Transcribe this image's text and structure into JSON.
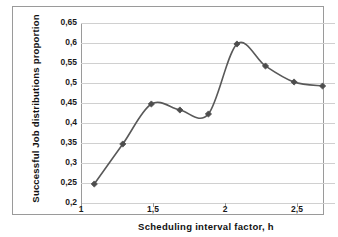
{
  "chart_data": {
    "type": "line",
    "title": "",
    "xlabel": "Scheduling interval factor, h",
    "ylabel": "Successful Job distributions proportion",
    "x": [
      1,
      1.2,
      1.4,
      1.6,
      1.8,
      2.0,
      2.2,
      2.4,
      2.6
    ],
    "values": [
      0.245,
      0.345,
      0.445,
      0.43,
      0.42,
      0.595,
      0.54,
      0.5,
      0.49
    ],
    "series": [
      {
        "name": "Successful Job distributions proportion",
        "values": [
          0.245,
          0.345,
          0.445,
          0.43,
          0.42,
          0.595,
          0.54,
          0.5,
          0.49
        ]
      }
    ],
    "xlim": [
      0.9,
      2.68
    ],
    "ylim": [
      0.2,
      0.65
    ],
    "x_ticks": [
      1,
      1.5,
      2,
      2.5
    ],
    "x_tick_labels": [
      "1",
      "1,5",
      "2",
      "2,5"
    ],
    "y_ticks": [
      0.2,
      0.25,
      0.3,
      0.35,
      0.4,
      0.45,
      0.5,
      0.55,
      0.6,
      0.65
    ],
    "y_tick_labels": [
      "0,2",
      "0,25",
      "0,3",
      "0,35",
      "0,4",
      "0,45",
      "0,5",
      "0,55",
      "0,6",
      "0,65"
    ],
    "grid": true,
    "grid_axis": "y",
    "legend": false,
    "legend_position": "none",
    "smooth": true,
    "marker": "diamond",
    "line_color": "#595959",
    "marker_color": "#4d4d4d",
    "grid_color": "#d0d0d0",
    "axis_color": "#9a9a9a",
    "background": "#ffffff"
  },
  "axes": {
    "y_labels": [
      "0,65",
      "0,6",
      "0,55",
      "0,5",
      "0,45",
      "0,4",
      "0,35",
      "0,3",
      "0,25",
      "0,2"
    ],
    "x_labels": [
      "1",
      "1,5",
      "2",
      "2,5"
    ],
    "x_title": "Scheduling interval factor, h",
    "y_title": "Successful Job distributions proportion"
  }
}
